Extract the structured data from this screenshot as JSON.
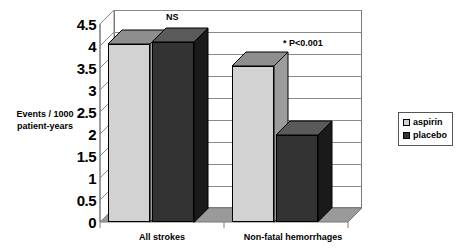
{
  "chart_data": {
    "type": "bar",
    "title": "",
    "subtitle": "",
    "xlabel": "",
    "ylabel": "Events / 1000 patient-years",
    "ylabel_line1": "Events / 1000",
    "ylabel_line2": "patient-years",
    "ylim": [
      0,
      4.5
    ],
    "ytick_step": 0.5,
    "yticks": [
      "4.5",
      "4",
      "3.5",
      "3",
      "2.5",
      "2",
      "1.5",
      "1",
      "0.5",
      "0"
    ],
    "ytick_values": [
      4.5,
      4,
      3.5,
      3,
      2.5,
      2,
      1.5,
      1,
      0.5,
      0
    ],
    "grid": true,
    "grid_axis": "y",
    "three_d": true,
    "legend_position": "right",
    "categories": [
      "All strokes",
      "Non-fatal hemorrhages"
    ],
    "series": [
      {
        "name": "aspirin",
        "color": "#d2d2d2",
        "values": [
          4.05,
          3.55
        ]
      },
      {
        "name": "placebo",
        "color": "#333333",
        "values": [
          4.1,
          1.97
        ]
      }
    ],
    "annotations": [
      {
        "text": "NS",
        "category": "All strokes",
        "note": "not significant"
      },
      {
        "text": "* P<0.001",
        "category": "Non-fatal hemorrhages",
        "note": "significant"
      }
    ]
  },
  "legend": {
    "items": [
      {
        "label": "aspirin",
        "color": "#d2d2d2"
      },
      {
        "label": "placebo",
        "color": "#333333"
      }
    ]
  },
  "colors": {
    "aspirin_front": "#d2d2d2",
    "aspirin_top": "#8e8e8e",
    "aspirin_side": "#9c9c9c",
    "placebo_front": "#333333",
    "placebo_top": "#5a5a5a",
    "placebo_side": "#1a1a1a",
    "floor": "#9a9a9a",
    "grid": "#8a8a8a",
    "axis": "#7a7a7a"
  }
}
